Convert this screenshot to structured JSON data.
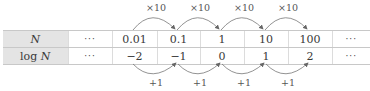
{
  "table": {
    "rows": [
      {
        "header": {
          "prefix": "",
          "var": "N"
        },
        "cells": [
          "···",
          "0.01",
          "0.1",
          "1",
          "10",
          "100",
          "···"
        ]
      },
      {
        "header": {
          "prefix": "log ",
          "var": "N"
        },
        "cells": [
          "···",
          "−2",
          "−1",
          "0",
          "1",
          "2",
          "···"
        ]
      }
    ]
  },
  "top_arrows": {
    "labels": [
      "×10",
      "×10",
      "×10",
      "×10"
    ]
  },
  "bottom_arrows": {
    "labels": [
      "+1",
      "+1",
      "+1",
      "+1"
    ]
  },
  "colors": {
    "header_bg": "#e4e4e4",
    "border": "#c8c8c8",
    "arrow": "#666666"
  }
}
